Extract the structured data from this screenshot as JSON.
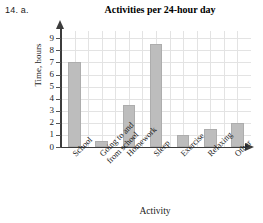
{
  "problem": {
    "label": "14.  a."
  },
  "chart_data": {
    "type": "bar",
    "title": "Activities per 24-hour day",
    "xlabel": "Activity",
    "ylabel": "Time, hours",
    "categories": [
      "School",
      "Going to and\nfrom school",
      "Homework",
      "Sleep",
      "Exercise",
      "Relaxing",
      "Other"
    ],
    "values": [
      7,
      0.5,
      3.5,
      8.5,
      1,
      1.5,
      2
    ],
    "ylim": [
      0,
      9.6
    ],
    "yticks": [
      0,
      1,
      2,
      3,
      4,
      5,
      6,
      7,
      8,
      9
    ],
    "ytick_labels": [
      "0",
      "1",
      "2",
      "3",
      "4",
      "5",
      "6",
      "7",
      "8",
      "9"
    ],
    "grid": true,
    "legend": null,
    "bar_color": "#bdbdbd",
    "bar_edge_color": "#adadad",
    "grid_color": "#e3e3e3",
    "axis_color": "#3c3c3c"
  }
}
